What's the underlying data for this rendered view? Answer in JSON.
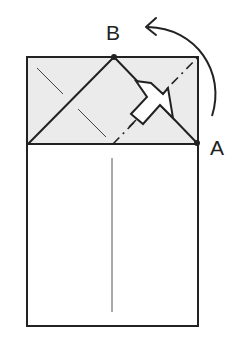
{
  "diagram": {
    "type": "origami fold step",
    "labels": {
      "point_b": "B",
      "point_a": "A"
    },
    "colors": {
      "stroke": "#222222",
      "shaded_flap": "#ebebeb",
      "background": "#ffffff"
    },
    "elements": [
      "paper rectangle",
      "shaded upper flap",
      "diagonal edges from left corner to B and B to A",
      "dash-dot valley fold line",
      "push/flatten arrow",
      "curved rotate arrow from A to B",
      "center crease line",
      "thin crease lines"
    ]
  }
}
